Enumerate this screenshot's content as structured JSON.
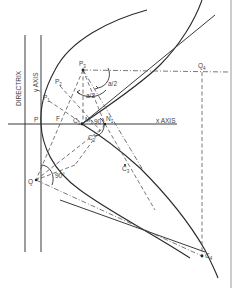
{
  "figure": {
    "labels": {
      "directrix": "DIRECTRIX",
      "y_axis": "y AXIS",
      "x_axis": "x AXIS",
      "vertex": "P",
      "focus": "F",
      "p1": "P",
      "p2": "P",
      "p3": "P",
      "p1_sub": "1",
      "p2_sub": "2",
      "p3_sub": "3",
      "c1": "C",
      "c1_sub": "1",
      "m": "M",
      "m_sub": "1",
      "n1": "N",
      "n1_sub": "1",
      "c2": "C",
      "c2_sub": "2",
      "c3": "C",
      "c3_sub": "3",
      "c4": "C",
      "c4_sub": "4",
      "q": "Q",
      "q4": "Q",
      "q4_sub": "4",
      "angle_half_a1": "a/2",
      "angle_half_a2": "a/2",
      "angle_90_1": "90°",
      "angle_90_2": "90°"
    }
  }
}
